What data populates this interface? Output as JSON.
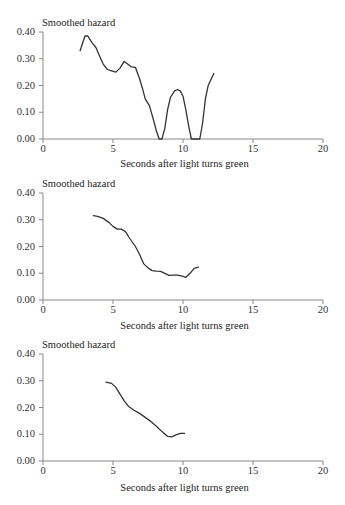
{
  "chart_data": [
    {
      "type": "line",
      "title": "",
      "ylabel": "Smoothed hazard",
      "xlabel": "Seconds after light turns green",
      "xlim": [
        0,
        20
      ],
      "ylim": [
        0,
        0.4
      ],
      "xticks": [
        "0",
        "5",
        "10",
        "15",
        "20"
      ],
      "yticks": [
        "0.00",
        "0.10",
        "0.20",
        "0.30",
        "0.40"
      ],
      "grid": false,
      "series": [
        {
          "name": "hazard",
          "x": [
            2.65,
            3.0,
            3.2,
            3.5,
            3.8,
            4.0,
            4.3,
            4.6,
            4.9,
            5.2,
            5.5,
            5.8,
            6.0,
            6.3,
            6.6,
            6.9,
            7.1,
            7.3,
            7.6,
            7.9,
            8.1,
            8.3,
            8.5,
            8.7,
            8.9,
            9.1,
            9.4,
            9.6,
            9.8,
            10.0,
            10.2,
            10.4,
            10.6,
            10.9,
            11.2,
            11.4,
            11.6,
            11.8,
            12.2
          ],
          "y": [
            0.33,
            0.385,
            0.385,
            0.36,
            0.34,
            0.315,
            0.28,
            0.26,
            0.255,
            0.25,
            0.265,
            0.29,
            0.282,
            0.27,
            0.268,
            0.225,
            0.19,
            0.15,
            0.125,
            0.07,
            0.03,
            0.0,
            0.0,
            0.04,
            0.11,
            0.155,
            0.18,
            0.185,
            0.18,
            0.16,
            0.11,
            0.05,
            0.0,
            0.0,
            0.0,
            0.06,
            0.15,
            0.2,
            0.245
          ]
        }
      ]
    },
    {
      "type": "line",
      "title": "",
      "ylabel": "Smoothed hazard",
      "xlabel": "Seconds after light turns green",
      "xlim": [
        0,
        20
      ],
      "ylim": [
        0,
        0.4
      ],
      "xticks": [
        "0",
        "5",
        "10",
        "15",
        "20"
      ],
      "yticks": [
        "0.00",
        "0.10",
        "0.20",
        "0.30",
        "0.40"
      ],
      "grid": false,
      "series": [
        {
          "name": "hazard",
          "x": [
            3.6,
            3.9,
            4.3,
            4.7,
            5.0,
            5.3,
            5.6,
            5.9,
            6.2,
            6.6,
            6.9,
            7.2,
            7.5,
            7.8,
            8.1,
            8.4,
            8.7,
            9.0,
            9.3,
            9.6,
            9.9,
            10.2,
            10.5,
            10.8,
            11.1
          ],
          "y": [
            0.315,
            0.313,
            0.305,
            0.29,
            0.275,
            0.265,
            0.265,
            0.255,
            0.23,
            0.2,
            0.17,
            0.135,
            0.12,
            0.11,
            0.108,
            0.107,
            0.1,
            0.092,
            0.093,
            0.093,
            0.09,
            0.085,
            0.1,
            0.118,
            0.123
          ]
        }
      ]
    },
    {
      "type": "line",
      "title": "",
      "ylabel": "Smoothed hazard",
      "xlabel": "Seconds after light turns green",
      "xlim": [
        0,
        20
      ],
      "ylim": [
        0,
        0.4
      ],
      "xticks": [
        "0",
        "5",
        "10",
        "15",
        "20"
      ],
      "yticks": [
        "0.00",
        "0.10",
        "0.20",
        "0.30",
        "0.40"
      ],
      "grid": false,
      "series": [
        {
          "name": "hazard",
          "x": [
            4.5,
            4.9,
            5.2,
            5.5,
            5.8,
            6.1,
            6.5,
            6.9,
            7.3,
            7.7,
            8.1,
            8.5,
            8.9,
            9.2,
            9.5,
            9.8,
            10.1
          ],
          "y": [
            0.295,
            0.29,
            0.275,
            0.25,
            0.225,
            0.205,
            0.19,
            0.178,
            0.163,
            0.148,
            0.13,
            0.11,
            0.092,
            0.09,
            0.098,
            0.103,
            0.103
          ]
        }
      ]
    }
  ],
  "charts": [
    {
      "ylabel": "Smoothed hazard",
      "xlabel": "Seconds after light turns green",
      "yticks": [
        "0.40",
        "0.30",
        "0.20",
        "0.10",
        "0.00"
      ],
      "xticks": [
        "0",
        "5",
        "10",
        "15",
        "20"
      ]
    },
    {
      "ylabel": "Smoothed hazard",
      "xlabel": "Seconds after light turns green",
      "yticks": [
        "0.40",
        "0.30",
        "0.20",
        "0.10",
        "0.00"
      ],
      "xticks": [
        "0",
        "5",
        "10",
        "15",
        "20"
      ]
    },
    {
      "ylabel": "Smoothed hazard",
      "xlabel": "Seconds after light turns green",
      "yticks": [
        "0.40",
        "0.30",
        "0.20",
        "0.10",
        "0.00"
      ],
      "xticks": [
        "0",
        "5",
        "10",
        "15",
        "20"
      ]
    }
  ],
  "style": {
    "axis_color": "#888888",
    "line_color": "#333333"
  }
}
